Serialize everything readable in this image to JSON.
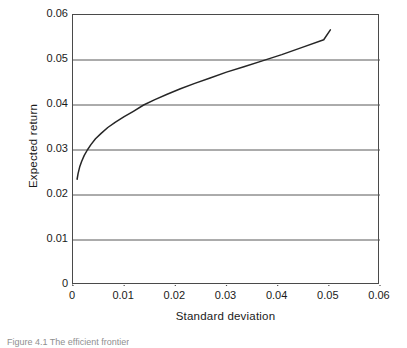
{
  "chart_data": {
    "type": "line",
    "title": "",
    "xlabel": "Standard deviation",
    "ylabel": "Expected return",
    "xlim": [
      0,
      0.06
    ],
    "ylim": [
      0,
      0.06
    ],
    "xticks": [
      "0",
      "0.01",
      "0.02",
      "0.03",
      "0.04",
      "0.05",
      "0.06"
    ],
    "xtick_values": [
      0,
      0.01,
      0.02,
      0.03,
      0.04,
      0.05,
      0.06
    ],
    "yticks": [
      "0",
      "0.01",
      "0.02",
      "0.03",
      "0.04",
      "0.05",
      "0.06"
    ],
    "ytick_values": [
      0,
      0.01,
      0.02,
      0.03,
      0.04,
      0.05,
      0.06
    ],
    "grid": "horizontal",
    "legend": "none",
    "series": [
      {
        "name": "Efficient frontier",
        "color": "#262626",
        "x": [
          0.0008,
          0.001,
          0.0013,
          0.0017,
          0.0022,
          0.0028,
          0.0035,
          0.0044,
          0.0055,
          0.0068,
          0.0083,
          0.01,
          0.0118,
          0.0138,
          0.016,
          0.0184,
          0.021,
          0.0238,
          0.0268,
          0.03,
          0.0334,
          0.037,
          0.0408,
          0.0448,
          0.049,
          0.0503
        ],
        "y": [
          0.0235,
          0.0248,
          0.0262,
          0.0275,
          0.0288,
          0.03,
          0.0312,
          0.0325,
          0.0337,
          0.035,
          0.0362,
          0.0374,
          0.0386,
          0.04,
          0.0412,
          0.0424,
          0.0436,
          0.0448,
          0.046,
          0.0473,
          0.0485,
          0.0498,
          0.0512,
          0.0528,
          0.0545,
          0.0567
        ]
      }
    ],
    "annotations": []
  },
  "caption": {
    "text": "Figure 4.1  The efficient frontier"
  }
}
